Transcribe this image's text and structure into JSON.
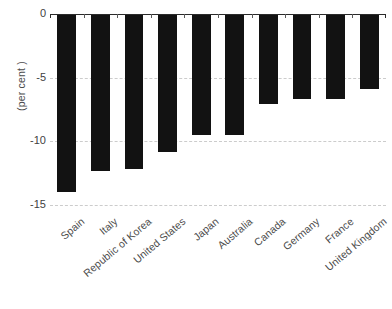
{
  "chart_data": {
    "type": "bar",
    "title": "",
    "xlabel": "",
    "ylabel": "(per cent )",
    "categories": [
      "Spain",
      "Italy",
      "Republic of Korea",
      "United States",
      "Japan",
      "Australia",
      "Canada",
      "Germany",
      "France",
      "United Kingdom"
    ],
    "values": [
      -14.0,
      -12.3,
      -12.2,
      -10.8,
      -9.5,
      -9.5,
      -7.1,
      -6.7,
      -6.7,
      -5.9
    ],
    "ylim": [
      -15,
      0
    ],
    "yticks": [
      0,
      -5,
      -10,
      -15
    ],
    "ytick_labels": [
      "0",
      "-5",
      "-10",
      "-15"
    ],
    "grid": true,
    "gridlines_at": [
      -5,
      -10,
      -15
    ],
    "legend": "none",
    "bar_color": "#121212",
    "gridline_color": "#cccccc",
    "axis_color": "#2b2b2b",
    "text_color": "#4a4a4a"
  }
}
